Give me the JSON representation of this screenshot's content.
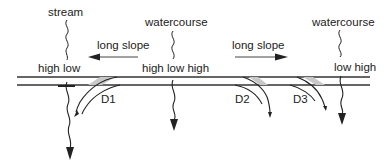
{
  "diagram": {
    "labels": {
      "stream": "stream",
      "watercourse_center": "watercourse",
      "watercourse_right": "watercourse",
      "long_slope_left": "long slope",
      "long_slope_right": "long slope",
      "high_low_left": "high low",
      "high_low_high_center": "high low high",
      "low_high_right": "low high",
      "d1": "D1",
      "d2": "D2",
      "d3": "D3"
    },
    "colors": {
      "line": "#222222",
      "shading": "#c8c8c8",
      "text": "#222222"
    }
  }
}
